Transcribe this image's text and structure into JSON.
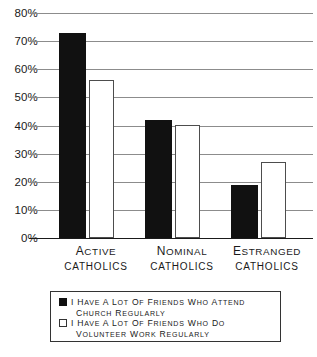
{
  "chart_data": {
    "type": "bar",
    "title": "",
    "xlabel": "",
    "ylabel": "",
    "ylim": [
      0,
      80
    ],
    "grid": true,
    "legend_position": "bottom",
    "categories": [
      "Active catholics",
      "Nominal catholics",
      "Estranged catholics"
    ],
    "category_lines": [
      {
        "line1": "Active",
        "line2": "catholics"
      },
      {
        "line1": "Nominal",
        "line2": "catholics"
      },
      {
        "line1": "Estranged",
        "line2": "catholics"
      }
    ],
    "ytick_labels": [
      "80%",
      "70%",
      "60%",
      "50%",
      "40%",
      "30%",
      "20%",
      "10%",
      "0%"
    ],
    "ytick_values": [
      80,
      70,
      60,
      50,
      40,
      30,
      20,
      10,
      0
    ],
    "series": [
      {
        "name": "I have a lot of friends who attend church regularly",
        "color": "#111111",
        "values": [
          73,
          42,
          19
        ]
      },
      {
        "name": "I have a lot of friends who do volunteer work regularly",
        "color": "#ffffff",
        "values": [
          56,
          40,
          27
        ]
      }
    ]
  },
  "legend": {
    "entries": [
      {
        "swatch": "dark",
        "line1": "I have a lot of friends who attend",
        "line2": "church regularly"
      },
      {
        "swatch": "light",
        "line1": "I have a lot of friends who do",
        "line2": "volunteer work regularly"
      }
    ]
  },
  "colors": {
    "series_dark": "#111111",
    "series_light": "#ffffff",
    "gridline": "#8c8c8c",
    "axis": "#1a1a1a",
    "legend_border": "#333333",
    "background": "#ffffff"
  }
}
